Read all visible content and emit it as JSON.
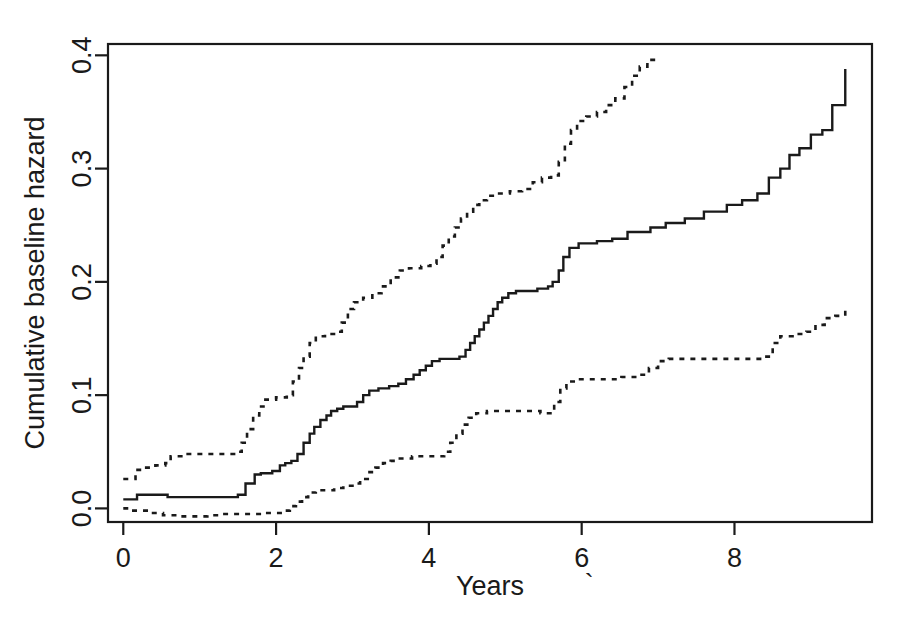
{
  "chart_data": {
    "type": "line",
    "title": "",
    "subtitle": "",
    "xlabel": "Years",
    "ylabel": "Cumulative baseline hazard",
    "xlim": [
      -0.2,
      9.8
    ],
    "ylim": [
      -0.012,
      0.41
    ],
    "xticks": [
      0,
      2,
      4,
      6,
      8
    ],
    "xtick_labels": [
      "0",
      "2",
      "4",
      "6",
      "8"
    ],
    "yticks": [
      0.0,
      0.1,
      0.2,
      0.3,
      0.4
    ],
    "ytick_labels": [
      "0.0",
      "0.1",
      "0.2",
      "0.3",
      "0.4"
    ],
    "grid": false,
    "legend": null,
    "legend_position": "none",
    "frame": "box",
    "annotations": [
      {
        "text": "`",
        "note": "small stray backtick mark right of the x-axis title",
        "x": 6.1,
        "y": -0.075
      }
    ],
    "series": [
      {
        "name": "Cumulative baseline hazard estimate",
        "style": "solid",
        "step": "post",
        "color": "#1a1a1a",
        "points": [
          [
            0.0,
            0.008
          ],
          [
            0.1,
            0.008
          ],
          [
            0.18,
            0.012
          ],
          [
            0.55,
            0.012
          ],
          [
            0.58,
            0.01
          ],
          [
            1.42,
            0.01
          ],
          [
            1.5,
            0.012
          ],
          [
            1.6,
            0.022
          ],
          [
            1.72,
            0.03
          ],
          [
            1.8,
            0.031
          ],
          [
            1.95,
            0.033
          ],
          [
            2.05,
            0.038
          ],
          [
            2.12,
            0.04
          ],
          [
            2.2,
            0.042
          ],
          [
            2.28,
            0.048
          ],
          [
            2.36,
            0.058
          ],
          [
            2.44,
            0.066
          ],
          [
            2.5,
            0.072
          ],
          [
            2.58,
            0.078
          ],
          [
            2.66,
            0.082
          ],
          [
            2.72,
            0.086
          ],
          [
            2.8,
            0.088
          ],
          [
            2.88,
            0.09
          ],
          [
            3.0,
            0.09
          ],
          [
            3.06,
            0.094
          ],
          [
            3.14,
            0.1
          ],
          [
            3.22,
            0.104
          ],
          [
            3.34,
            0.106
          ],
          [
            3.48,
            0.108
          ],
          [
            3.6,
            0.11
          ],
          [
            3.7,
            0.114
          ],
          [
            3.8,
            0.118
          ],
          [
            3.88,
            0.122
          ],
          [
            3.96,
            0.126
          ],
          [
            4.04,
            0.13
          ],
          [
            4.14,
            0.132
          ],
          [
            4.32,
            0.132
          ],
          [
            4.4,
            0.134
          ],
          [
            4.48,
            0.14
          ],
          [
            4.54,
            0.146
          ],
          [
            4.6,
            0.152
          ],
          [
            4.66,
            0.158
          ],
          [
            4.72,
            0.164
          ],
          [
            4.78,
            0.17
          ],
          [
            4.84,
            0.176
          ],
          [
            4.9,
            0.182
          ],
          [
            4.96,
            0.186
          ],
          [
            5.04,
            0.19
          ],
          [
            5.14,
            0.192
          ],
          [
            5.3,
            0.192
          ],
          [
            5.42,
            0.194
          ],
          [
            5.56,
            0.196
          ],
          [
            5.62,
            0.2
          ],
          [
            5.7,
            0.21
          ],
          [
            5.76,
            0.222
          ],
          [
            5.84,
            0.23
          ],
          [
            5.96,
            0.234
          ],
          [
            6.2,
            0.236
          ],
          [
            6.4,
            0.238
          ],
          [
            6.6,
            0.244
          ],
          [
            6.9,
            0.248
          ],
          [
            7.1,
            0.252
          ],
          [
            7.35,
            0.256
          ],
          [
            7.6,
            0.262
          ],
          [
            7.9,
            0.268
          ],
          [
            8.1,
            0.272
          ],
          [
            8.3,
            0.278
          ],
          [
            8.45,
            0.292
          ],
          [
            8.6,
            0.3
          ],
          [
            8.72,
            0.312
          ],
          [
            8.85,
            0.318
          ],
          [
            9.0,
            0.33
          ],
          [
            9.15,
            0.334
          ],
          [
            9.28,
            0.356
          ],
          [
            9.42,
            0.356
          ],
          [
            9.45,
            0.388
          ]
        ]
      },
      {
        "name": "Upper 95% confidence band",
        "style": "dotted",
        "step": "post",
        "color": "#1a1a1a",
        "points": [
          [
            0.0,
            0.026
          ],
          [
            0.08,
            0.026
          ],
          [
            0.16,
            0.034
          ],
          [
            0.3,
            0.036
          ],
          [
            0.42,
            0.038
          ],
          [
            0.55,
            0.04
          ],
          [
            0.62,
            0.046
          ],
          [
            0.78,
            0.048
          ],
          [
            1.0,
            0.048
          ],
          [
            1.25,
            0.048
          ],
          [
            1.45,
            0.05
          ],
          [
            1.55,
            0.058
          ],
          [
            1.62,
            0.07
          ],
          [
            1.7,
            0.082
          ],
          [
            1.78,
            0.09
          ],
          [
            1.86,
            0.096
          ],
          [
            2.0,
            0.098
          ],
          [
            2.14,
            0.1
          ],
          [
            2.22,
            0.112
          ],
          [
            2.3,
            0.124
          ],
          [
            2.36,
            0.134
          ],
          [
            2.44,
            0.146
          ],
          [
            2.52,
            0.152
          ],
          [
            2.64,
            0.154
          ],
          [
            2.78,
            0.156
          ],
          [
            2.86,
            0.164
          ],
          [
            2.94,
            0.176
          ],
          [
            3.02,
            0.182
          ],
          [
            3.14,
            0.186
          ],
          [
            3.26,
            0.19
          ],
          [
            3.38,
            0.196
          ],
          [
            3.5,
            0.204
          ],
          [
            3.62,
            0.21
          ],
          [
            3.74,
            0.212
          ],
          [
            3.9,
            0.214
          ],
          [
            4.02,
            0.216
          ],
          [
            4.1,
            0.222
          ],
          [
            4.18,
            0.232
          ],
          [
            4.26,
            0.24
          ],
          [
            4.34,
            0.248
          ],
          [
            4.42,
            0.256
          ],
          [
            4.5,
            0.262
          ],
          [
            4.58,
            0.268
          ],
          [
            4.66,
            0.272
          ],
          [
            4.76,
            0.276
          ],
          [
            4.9,
            0.278
          ],
          [
            5.06,
            0.28
          ],
          [
            5.22,
            0.282
          ],
          [
            5.36,
            0.288
          ],
          [
            5.48,
            0.292
          ],
          [
            5.6,
            0.294
          ],
          [
            5.7,
            0.306
          ],
          [
            5.78,
            0.322
          ],
          [
            5.86,
            0.334
          ],
          [
            5.94,
            0.342
          ],
          [
            6.06,
            0.346
          ],
          [
            6.2,
            0.35
          ],
          [
            6.32,
            0.356
          ],
          [
            6.44,
            0.362
          ],
          [
            6.56,
            0.372
          ],
          [
            6.66,
            0.382
          ],
          [
            6.76,
            0.39
          ],
          [
            6.86,
            0.396
          ],
          [
            6.97,
            0.398
          ]
        ]
      },
      {
        "name": "Lower 95% confidence band",
        "style": "dotted",
        "step": "post",
        "color": "#1a1a1a",
        "points": [
          [
            0.0,
            0.0
          ],
          [
            0.1,
            -0.002
          ],
          [
            0.22,
            -0.002
          ],
          [
            0.36,
            -0.004
          ],
          [
            0.52,
            -0.006
          ],
          [
            0.7,
            -0.007
          ],
          [
            0.9,
            -0.007
          ],
          [
            1.1,
            -0.006
          ],
          [
            1.26,
            -0.005
          ],
          [
            1.4,
            -0.005
          ],
          [
            1.56,
            -0.005
          ],
          [
            1.7,
            -0.005
          ],
          [
            1.84,
            -0.004
          ],
          [
            1.96,
            -0.004
          ],
          [
            2.08,
            -0.002
          ],
          [
            2.18,
            0.002
          ],
          [
            2.26,
            0.006
          ],
          [
            2.34,
            0.01
          ],
          [
            2.42,
            0.014
          ],
          [
            2.52,
            0.016
          ],
          [
            2.64,
            0.016
          ],
          [
            2.76,
            0.018
          ],
          [
            2.88,
            0.02
          ],
          [
            3.0,
            0.022
          ],
          [
            3.1,
            0.026
          ],
          [
            3.2,
            0.032
          ],
          [
            3.3,
            0.036
          ],
          [
            3.4,
            0.04
          ],
          [
            3.5,
            0.042
          ],
          [
            3.62,
            0.044
          ],
          [
            3.78,
            0.046
          ],
          [
            3.96,
            0.046
          ],
          [
            4.1,
            0.046
          ],
          [
            4.2,
            0.05
          ],
          [
            4.28,
            0.058
          ],
          [
            4.36,
            0.066
          ],
          [
            4.44,
            0.074
          ],
          [
            4.52,
            0.08
          ],
          [
            4.62,
            0.084
          ],
          [
            4.76,
            0.086
          ],
          [
            4.92,
            0.086
          ],
          [
            5.1,
            0.086
          ],
          [
            5.28,
            0.086
          ],
          [
            5.46,
            0.084
          ],
          [
            5.56,
            0.084
          ],
          [
            5.64,
            0.094
          ],
          [
            5.72,
            0.106
          ],
          [
            5.8,
            0.112
          ],
          [
            5.94,
            0.114
          ],
          [
            6.12,
            0.114
          ],
          [
            6.32,
            0.114
          ],
          [
            6.52,
            0.116
          ],
          [
            6.72,
            0.118
          ],
          [
            6.88,
            0.124
          ],
          [
            7.0,
            0.13
          ],
          [
            7.14,
            0.132
          ],
          [
            7.34,
            0.132
          ],
          [
            7.56,
            0.132
          ],
          [
            7.8,
            0.132
          ],
          [
            8.04,
            0.132
          ],
          [
            8.24,
            0.132
          ],
          [
            8.4,
            0.134
          ],
          [
            8.5,
            0.146
          ],
          [
            8.6,
            0.152
          ],
          [
            8.76,
            0.154
          ],
          [
            8.94,
            0.156
          ],
          [
            9.06,
            0.162
          ],
          [
            9.18,
            0.168
          ],
          [
            9.32,
            0.17
          ],
          [
            9.42,
            0.17
          ],
          [
            9.45,
            0.178
          ]
        ]
      }
    ]
  },
  "axes": {
    "x_title": "Years",
    "y_title": "Cumulative baseline hazard"
  }
}
